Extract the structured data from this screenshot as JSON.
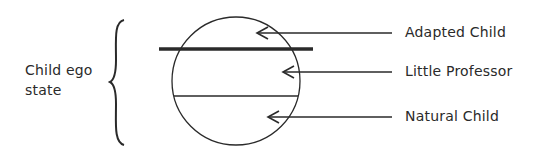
{
  "diagram": {
    "group_label": {
      "line1": "Child ego",
      "line2": "state"
    },
    "parts": [
      {
        "label": "Adapted Child"
      },
      {
        "label": "Little Professor"
      },
      {
        "label": "Natural Child"
      }
    ],
    "colors": {
      "ink": "#2a2a2a",
      "background": "#ffffff"
    }
  }
}
